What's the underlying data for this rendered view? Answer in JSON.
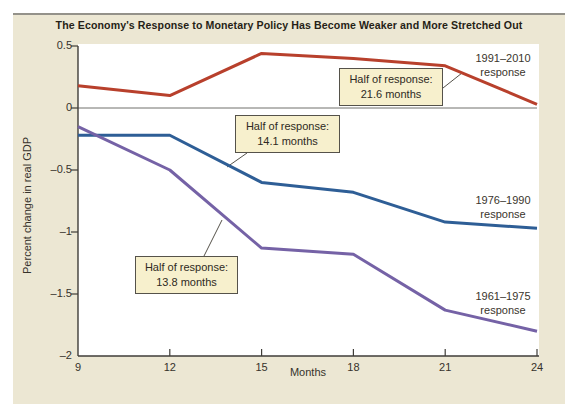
{
  "figure": {
    "title": "The Economy's Response to Monetary Policy Has Become Weaker and More Stretched Out",
    "x_axis_label": "Months",
    "y_axis_label": "Percent change in real GDP"
  },
  "series_labels": {
    "s1991": {
      "line1": "1991–2010",
      "line2": "response"
    },
    "s1976": {
      "line1": "1976–1990",
      "line2": "response"
    },
    "s1961": {
      "line1": "1961–1975",
      "line2": "response"
    }
  },
  "callouts": {
    "c21_6": {
      "line1": "Half of response:",
      "line2": "21.6 months"
    },
    "c14_1": {
      "line1": "Half of response:",
      "line2": "14.1 months"
    },
    "c13_8": {
      "line1": "Half of response:",
      "line2": "13.8 months"
    }
  },
  "colors": {
    "figure_background": "#ece7d3",
    "plot_background": "#ffffff",
    "axis": "#3f3d38",
    "zero_line": "#71706c",
    "callout_background": "#f7f0cd",
    "callout_border": "#55524a",
    "series_1991_2010": "#b8402c",
    "series_1976_1990": "#2e5e96",
    "series_1961_1975": "#7562a6"
  },
  "chart_data": {
    "type": "line",
    "title": "The Economy's Response to Monetary Policy Has Become Weaker and More Stretched Out",
    "xlabel": "Months",
    "ylabel": "Percent change in real GDP",
    "xlim": [
      9,
      24
    ],
    "ylim": [
      -2,
      0.5
    ],
    "grid": false,
    "x": [
      9,
      12,
      15,
      18,
      21,
      24
    ],
    "x_tick_labels": [
      "9",
      "12",
      "15",
      "18",
      "21",
      "24"
    ],
    "y_ticks": [
      0.5,
      0,
      -0.5,
      -1,
      -1.5,
      -2
    ],
    "y_tick_labels": [
      "0.5",
      "0",
      "–0.5",
      "–1",
      "–1.5",
      "–2"
    ],
    "series": [
      {
        "name": "1991–2010 response",
        "color": "#b8402c",
        "values": [
          0.18,
          0.1,
          0.44,
          0.4,
          0.34,
          0.03
        ],
        "half_of_response_months": 21.6
      },
      {
        "name": "1976–1990 response",
        "color": "#2e5e96",
        "values": [
          -0.22,
          -0.22,
          -0.6,
          -0.68,
          -0.92,
          -0.97
        ],
        "half_of_response_months": 14.1
      },
      {
        "name": "1961–1975 response",
        "color": "#7562a6",
        "values": [
          -0.15,
          -0.5,
          -1.13,
          -1.18,
          -1.63,
          -1.8
        ],
        "half_of_response_months": 13.8
      }
    ],
    "leader_lines": [
      {
        "from": [
          443,
          88
        ],
        "to": [
          462,
          73
        ]
      },
      {
        "from": [
          247,
          153
        ],
        "to": [
          227,
          167
        ]
      },
      {
        "from": [
          204,
          256
        ],
        "to": [
          222,
          220
        ]
      }
    ]
  }
}
